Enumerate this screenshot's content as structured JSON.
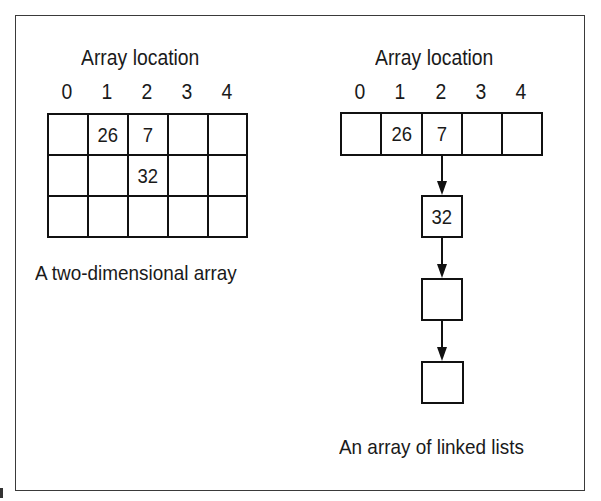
{
  "left_diagram": {
    "title": "Array location",
    "indices": [
      "0",
      "1",
      "2",
      "3",
      "4"
    ],
    "grid": [
      [
        "",
        "26",
        "7",
        "",
        ""
      ],
      [
        "",
        "",
        "32",
        "",
        ""
      ],
      [
        "",
        "",
        "",
        "",
        ""
      ]
    ],
    "caption": "A two-dimensional array"
  },
  "right_diagram": {
    "title": "Array location",
    "indices": [
      "0",
      "1",
      "2",
      "3",
      "4"
    ],
    "array": [
      "",
      "26",
      "7",
      "",
      ""
    ],
    "linked_nodes": [
      "32",
      "",
      ""
    ],
    "linked_from_index": 2,
    "caption": "An array of linked lists"
  }
}
